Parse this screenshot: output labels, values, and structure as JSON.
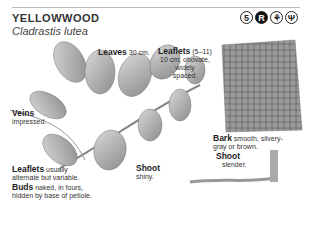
{
  "header": {
    "title": "YELLOWWOOD",
    "latin_name": "Cladrastis lutea",
    "icons": [
      {
        "name": "size-5-icon",
        "glyph": "5"
      },
      {
        "name": "rare-icon",
        "glyph": "R"
      },
      {
        "name": "tree-shape-icon",
        "glyph": "⚘"
      },
      {
        "name": "branch-icon",
        "glyph": "Ψ"
      }
    ]
  },
  "labels": {
    "leaves": {
      "bold": "Leaves",
      "text": " 30 cm."
    },
    "leaflets_top": {
      "bold": "Leaflets",
      "text": " (5–11)",
      "line2": "10 cm, obovate,",
      "line3": "widely",
      "line4": "spaced."
    },
    "veins": {
      "bold": "Veins",
      "text": "impressed."
    },
    "leaflets_bottom": {
      "bold": "Leaflets",
      "text": " usually",
      "line2": "alternate but variable."
    },
    "buds": {
      "bold": "Buds",
      "text": " naked, in fours,",
      "line2": "hidden by base of petiole."
    },
    "shoot_left": {
      "bold": "Shoot",
      "text": "shiny."
    },
    "bark": {
      "bold": "Bark",
      "text": " smooth, silvery-",
      "line2": "gray or brown."
    },
    "shoot_right": {
      "bold": "Shoot",
      "text": "slender."
    }
  },
  "colors": {
    "leaf": "#9a9a9a",
    "bark": "#8a8a8a",
    "rule": "#bbbbbb"
  }
}
